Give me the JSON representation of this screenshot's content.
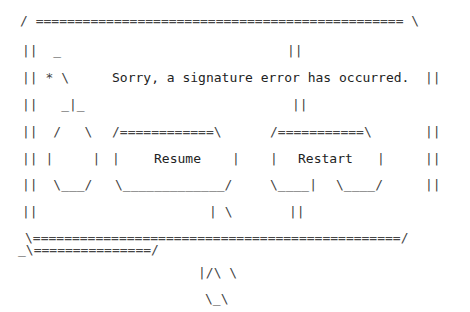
{
  "dialog": {
    "message": "Sorry, a signature error has occurred.",
    "buttons": {
      "resume": "Resume",
      "restart": "Restart"
    },
    "lines": {
      "top_border": "/ =============================================== \\",
      "l1_left": "||  _",
      "l1_mid": "||",
      "l2_left": "|| * \\",
      "l2_right": "||",
      "l3_left": "||   _|_",
      "l3_mid": "||",
      "l4_left": "||  /   \\",
      "l4_resume_top": "/============\\",
      "l4_restart_top": "/===========\\",
      "l4_right": "||",
      "l5_left": "|| |     |",
      "l5_resume_l": "|",
      "l5_resume_r": "|",
      "l5_restart_l": "|",
      "l5_restart_r": "|",
      "l5_right": "||",
      "l6_left": "||  \\___/",
      "l6_resume_bottom": "\\_____________/",
      "l6_restart_bottom_a": "\\____|",
      "l6_restart_bottom_b": "\\____/",
      "l6_right": "||",
      "l7_left": "||",
      "l7_mid": "| \\",
      "l7_mid2": "||",
      "bottom_border": "\\===============================================/",
      "tail_border": "_\\===============/",
      "tail1": "|/\\ \\",
      "tail2": "\\_\\"
    }
  }
}
